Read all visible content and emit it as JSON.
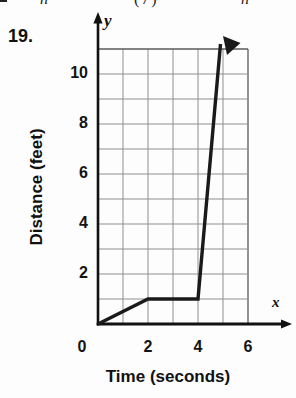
{
  "page": {
    "problem_number": "19.",
    "top_fragments": [
      "n",
      "(7)",
      "n"
    ]
  },
  "chart_data": {
    "type": "line",
    "title": "",
    "xlabel": "Time (seconds)",
    "ylabel": "Distance (feet)",
    "x_axis_symbol": "x",
    "y_axis_symbol": "y",
    "xlim": [
      0,
      6
    ],
    "ylim": [
      0,
      11
    ],
    "xticks": [
      0,
      2,
      4,
      6
    ],
    "yticks": [
      2,
      4,
      6,
      8,
      10
    ],
    "grid": true,
    "grid_step": 1,
    "legend": false,
    "points": [
      [
        0,
        0
      ],
      [
        2,
        1
      ],
      [
        4,
        1
      ],
      [
        4.9,
        11.2
      ]
    ],
    "end_arrow": true,
    "colors": {
      "line": "#1a1a1a",
      "grid": "#8f8f8f",
      "grid_border": "#5a5a5a",
      "axis": "#111111",
      "text": "#111111",
      "background": "#fdfdfd"
    }
  }
}
